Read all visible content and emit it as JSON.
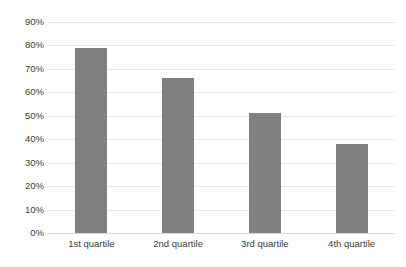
{
  "chart_data": {
    "type": "bar",
    "title": "",
    "subtitle": "",
    "xlabel": "",
    "ylabel": "",
    "categories": [
      "1st quartile",
      "2nd quartile",
      "3rd quartile",
      "4th quartile"
    ],
    "values": [
      79,
      66,
      51,
      38
    ],
    "value_labels": [
      "79%",
      "66%",
      "51%",
      "38%"
    ],
    "ylim": [
      0,
      90
    ],
    "ytick_values": [
      0,
      10,
      20,
      30,
      40,
      50,
      60,
      70,
      80,
      90
    ],
    "ytick_labels": [
      "0%",
      "10%",
      "20%",
      "30%",
      "40%",
      "50%",
      "60%",
      "70%",
      "80%",
      "90%"
    ],
    "grid": {
      "horizontal": true,
      "vertical": false,
      "color": "#e8e8e8"
    },
    "legend": {
      "visible": false,
      "position": "none",
      "entries": []
    },
    "series": [
      {
        "name": "",
        "color": "#808080",
        "values": [
          79,
          66,
          51,
          38
        ]
      }
    ],
    "annotations": [],
    "colors": {
      "bar": "#808080",
      "gridline": "#e8e8e8",
      "baseline": "#d9d9d9",
      "tick_label": "#3b3b3b",
      "background": "#ffffff"
    }
  }
}
